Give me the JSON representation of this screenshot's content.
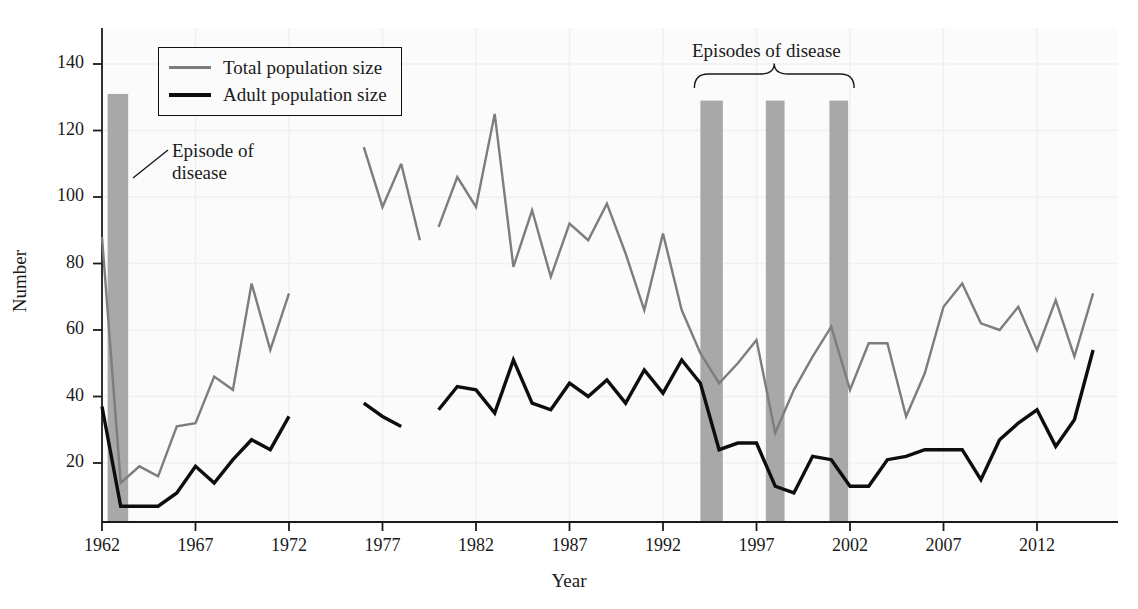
{
  "chart_data": {
    "type": "line",
    "title": "",
    "xlabel": "Year",
    "ylabel": "Number",
    "xlim": [
      1962,
      2015
    ],
    "ylim": [
      0,
      147
    ],
    "yticks": [
      20,
      40,
      60,
      80,
      100,
      120,
      140
    ],
    "xticks": [
      1962,
      1967,
      1972,
      1977,
      1982,
      1987,
      1992,
      1997,
      2002,
      2007,
      2012
    ],
    "grid": "faint",
    "legend_position": "top-left",
    "colors": {
      "total": "#7d7d7d",
      "adult": "#0d0d0d",
      "episode_band": "#a8a8a8",
      "background": "#fbfbfb",
      "axis": "#1a1a1a"
    },
    "series": [
      {
        "name": "Total population size",
        "color": "#7d7d7d",
        "segments": [
          {
            "x": [
              1962,
              1963,
              1964,
              1965,
              1966,
              1967,
              1968,
              1969,
              1970,
              1971,
              1972
            ],
            "y": [
              88,
              14,
              19,
              16,
              31,
              32,
              46,
              42,
              74,
              54,
              71
            ]
          },
          {
            "x": [
              1976,
              1977,
              1978
            ],
            "y": [
              115,
              97,
              110
            ]
          },
          {
            "x": [
              1978,
              1979
            ],
            "y": [
              110,
              87
            ]
          },
          {
            "x": [
              1980,
              1981,
              1982,
              1983,
              1984,
              1985,
              1986,
              1987,
              1988,
              1989,
              1990,
              1991,
              1992,
              1993,
              1994,
              1995,
              1996,
              1997,
              1998,
              1999,
              2000,
              2001,
              2002,
              2003,
              2004,
              2005,
              2006,
              2007,
              2008,
              2009,
              2010,
              2011,
              2012,
              2013,
              2014,
              2015
            ],
            "y": [
              91,
              106,
              97,
              125,
              79,
              96,
              76,
              92,
              87,
              98,
              83,
              66,
              89,
              66,
              53,
              44,
              50,
              57,
              29,
              42,
              52,
              61,
              42,
              56,
              56,
              34,
              47,
              67,
              74,
              62,
              60,
              67,
              54,
              69,
              52,
              71
            ]
          }
        ]
      },
      {
        "name": "Adult population size",
        "color": "#0d0d0d",
        "segments": [
          {
            "x": [
              1962,
              1963,
              1964,
              1965,
              1966,
              1967,
              1968,
              1969,
              1970,
              1971,
              1972
            ],
            "y": [
              37,
              7,
              7,
              7,
              11,
              19,
              14,
              21,
              27,
              24,
              34
            ]
          },
          {
            "x": [
              1976,
              1977,
              1978
            ],
            "y": [
              38,
              34,
              31
            ]
          },
          {
            "x": [
              1980,
              1981,
              1982,
              1983,
              1984,
              1985,
              1986,
              1987,
              1988,
              1989,
              1990,
              1991,
              1992,
              1993,
              1994,
              1995,
              1996,
              1997,
              1998,
              1999,
              2000,
              2001,
              2002,
              2003,
              2004,
              2005,
              2006,
              2007,
              2008,
              2009,
              2010,
              2011,
              2012,
              2013,
              2014,
              2015
            ],
            "y": [
              36,
              43,
              42,
              35,
              51,
              38,
              36,
              44,
              40,
              45,
              38,
              48,
              41,
              51,
              44,
              24,
              26,
              26,
              13,
              11,
              22,
              21,
              13,
              13,
              21,
              22,
              24,
              24,
              24,
              15,
              27,
              32,
              36,
              25,
              33,
              54
            ]
          }
        ]
      }
    ],
    "episode_bands": [
      {
        "label": "Episode of disease",
        "start": 1962.3,
        "end": 1963.4,
        "top": 131
      },
      {
        "label": "Episodes of disease",
        "start": 1994.0,
        "end": 1995.2,
        "top": 129
      },
      {
        "label": "Episodes of disease",
        "start": 1997.5,
        "end": 1998.5,
        "top": 129
      },
      {
        "label": "Episodes of disease",
        "start": 2000.9,
        "end": 2001.9,
        "top": 129
      }
    ]
  },
  "legend": {
    "items": [
      {
        "label": "Total population size",
        "key": "total"
      },
      {
        "label": "Adult population size",
        "key": "adult"
      }
    ]
  },
  "annotations": {
    "episode_single": "Episode of\ndisease",
    "episodes_group": "Episodes of disease"
  },
  "axes": {
    "y_title": "Number",
    "x_title": "Year",
    "y_ticks": [
      "20",
      "40",
      "60",
      "80",
      "100",
      "120",
      "140"
    ],
    "x_ticks": [
      "1962",
      "1967",
      "1972",
      "1977",
      "1982",
      "1987",
      "1992",
      "1997",
      "2002",
      "2007",
      "2012"
    ]
  }
}
